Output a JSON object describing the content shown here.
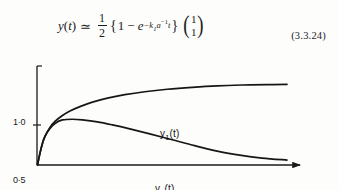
{
  "equation": {
    "lhs_function": "y",
    "lhs_variable": "t",
    "relation": "≃",
    "fraction_numerator": "1",
    "fraction_denominator": "2",
    "brace_open": "{",
    "one": "1",
    "minus": "−",
    "exp_base": "e",
    "exp_superscript_text": "−k₁a⁻¹t",
    "exp_minus": "−",
    "exp_k": "k",
    "exp_k_sub": "1",
    "exp_a": "a",
    "exp_a_pow": "−1",
    "exp_t": "t",
    "brace_close": "}",
    "vector_entry_1": "1",
    "vector_entry_2": "1",
    "paren_left": "(",
    "paren_right": ")",
    "number": "(3.3.24)",
    "plain_text": "y(t) ≃ ½{1 − e^(−k₁a⁻¹t)}(1, 1)ᵀ"
  },
  "chart_data": {
    "type": "line",
    "title": "",
    "xlabel": "time",
    "ylabel": "",
    "xlim": [
      0,
      1
    ],
    "ylim": [
      0,
      1.0
    ],
    "grid": false,
    "legend": "inline-labels",
    "y_tick_labels": [
      "1·0",
      "0·5",
      "0"
    ],
    "y_tick_values": [
      1.0,
      0.5,
      0
    ],
    "x_axis_arrow": true,
    "annotations": [
      {
        "name": "interaction",
        "text": "interaction",
        "x": 0.74,
        "y": 0.22
      }
    ],
    "series": [
      {
        "name": "y1(t)",
        "label": "y₁ (t)",
        "label_base": "y",
        "label_sub": "1",
        "label_suffix": "(t)",
        "color": "#161616",
        "x": [
          0.0,
          0.01,
          0.02,
          0.03,
          0.05,
          0.07,
          0.1,
          0.13,
          0.17,
          0.22,
          0.28,
          0.35,
          0.43,
          0.52,
          0.62,
          0.72,
          0.82,
          0.92,
          1.0
        ],
        "y": [
          0.0,
          0.12,
          0.22,
          0.29,
          0.38,
          0.44,
          0.5,
          0.545,
          0.59,
          0.635,
          0.675,
          0.71,
          0.74,
          0.765,
          0.785,
          0.8,
          0.808,
          0.812,
          0.815
        ]
      },
      {
        "name": "y2(t)",
        "label": "y₂(t)",
        "label_base": "y",
        "label_sub": "2",
        "label_suffix": "(t)",
        "color": "#161616",
        "x": [
          0.0,
          0.01,
          0.02,
          0.03,
          0.05,
          0.07,
          0.1,
          0.14,
          0.18,
          0.24,
          0.3,
          0.37,
          0.45,
          0.54,
          0.63,
          0.72,
          0.81,
          0.9,
          1.0
        ],
        "y": [
          0.0,
          0.12,
          0.22,
          0.29,
          0.37,
          0.42,
          0.455,
          0.462,
          0.455,
          0.435,
          0.405,
          0.365,
          0.315,
          0.255,
          0.195,
          0.14,
          0.1,
          0.07,
          0.05
        ]
      }
    ]
  }
}
